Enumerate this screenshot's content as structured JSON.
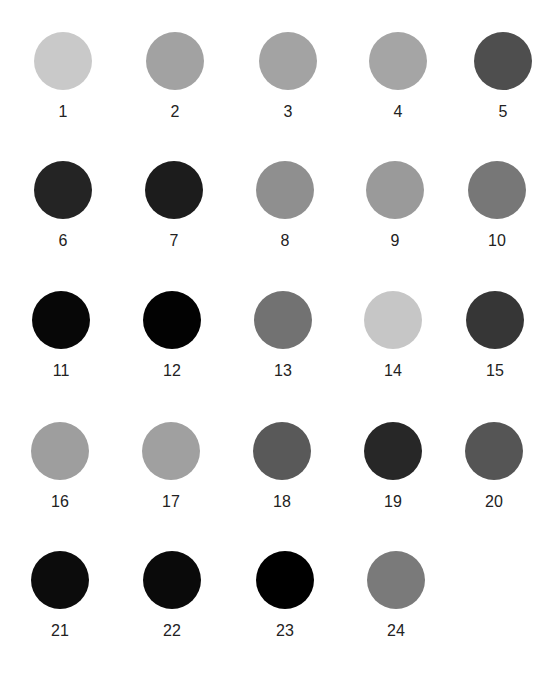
{
  "swatches": [
    {
      "label": "1",
      "color": "#c9c9c9",
      "x": 28,
      "y": 32
    },
    {
      "label": "2",
      "color": "#a2a2a2",
      "x": 140,
      "y": 32
    },
    {
      "label": "3",
      "color": "#a3a3a3",
      "x": 253,
      "y": 32
    },
    {
      "label": "4",
      "color": "#a5a5a5",
      "x": 363,
      "y": 32
    },
    {
      "label": "5",
      "color": "#4e4e4e",
      "x": 468,
      "y": 32
    },
    {
      "label": "6",
      "color": "#242424",
      "x": 28,
      "y": 161
    },
    {
      "label": "7",
      "color": "#1c1c1c",
      "x": 139,
      "y": 161
    },
    {
      "label": "8",
      "color": "#8f8f8f",
      "x": 250,
      "y": 161
    },
    {
      "label": "9",
      "color": "#9a9a9a",
      "x": 360,
      "y": 161
    },
    {
      "label": "10",
      "color": "#777777",
      "x": 462,
      "y": 161
    },
    {
      "label": "11",
      "color": "#070707",
      "x": 26,
      "y": 291
    },
    {
      "label": "12",
      "color": "#020202",
      "x": 137,
      "y": 291
    },
    {
      "label": "13",
      "color": "#727272",
      "x": 248,
      "y": 291
    },
    {
      "label": "14",
      "color": "#c6c6c6",
      "x": 358,
      "y": 291
    },
    {
      "label": "15",
      "color": "#363636",
      "x": 460,
      "y": 291
    },
    {
      "label": "16",
      "color": "#9e9e9e",
      "x": 25,
      "y": 422
    },
    {
      "label": "17",
      "color": "#a0a0a0",
      "x": 136,
      "y": 422
    },
    {
      "label": "18",
      "color": "#595959",
      "x": 247,
      "y": 422
    },
    {
      "label": "19",
      "color": "#272727",
      "x": 358,
      "y": 422
    },
    {
      "label": "20",
      "color": "#555555",
      "x": 459,
      "y": 422
    },
    {
      "label": "21",
      "color": "#0c0c0c",
      "x": 25,
      "y": 551
    },
    {
      "label": "22",
      "color": "#0a0a0a",
      "x": 137,
      "y": 551
    },
    {
      "label": "23",
      "color": "#000000",
      "x": 250,
      "y": 551
    },
    {
      "label": "24",
      "color": "#7a7a7a",
      "x": 361,
      "y": 551
    }
  ]
}
